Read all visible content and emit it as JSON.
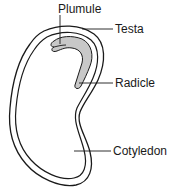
{
  "diagram": {
    "labels": {
      "plumule": "Plumule",
      "testa": "Testa",
      "radicle": "Radicle",
      "cotyledon": "Cotyledon"
    },
    "colors": {
      "outline": "#1a1a1a",
      "embryo_fill": "#c8c8c8",
      "background": "#ffffff"
    }
  }
}
